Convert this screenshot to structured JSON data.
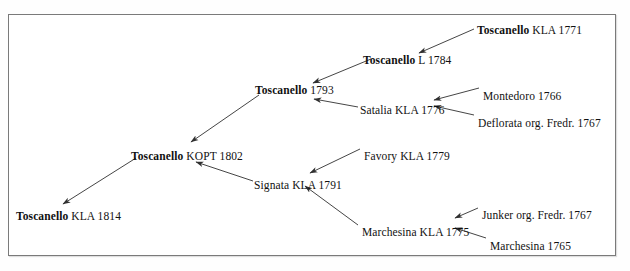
{
  "figure": {
    "kind": "pedigree-chart",
    "border_color": "#7a7a7a",
    "background": "#ffffff",
    "text_color": "#111111",
    "arrow_color": "#303030"
  },
  "nodes": [
    {
      "id": "toscanello-kla-1771",
      "name": "Toscanello",
      "bold": true,
      "detail": "KLA 1771",
      "x": 477,
      "y": 24,
      "align": "left"
    },
    {
      "id": "toscanello-l-1784",
      "name": "Toscanello",
      "bold": true,
      "detail": "L 1784",
      "x": 363,
      "y": 54,
      "align": "left"
    },
    {
      "id": "toscanello-1793",
      "name": "Toscanello",
      "bold": true,
      "detail": "1793",
      "x": 255,
      "y": 84,
      "align": "left"
    },
    {
      "id": "satalia-kla-1776",
      "name": "",
      "bold": false,
      "detail": "Satalia KLA 1776",
      "x": 360,
      "y": 104,
      "align": "left"
    },
    {
      "id": "montedoro-1766",
      "name": "",
      "bold": false,
      "detail": "Montedoro 1766",
      "x": 483,
      "y": 90,
      "align": "left"
    },
    {
      "id": "deflorata-org-fredr-1767",
      "name": "",
      "bold": false,
      "detail": "Deflorata org. Fredr. 1767",
      "x": 478,
      "y": 117,
      "align": "left"
    },
    {
      "id": "toscanello-kopt-1802",
      "name": "Toscanello",
      "bold": true,
      "detail": "KOPT 1802",
      "x": 131,
      "y": 150,
      "align": "left"
    },
    {
      "id": "favory-kla-1779",
      "name": "",
      "bold": false,
      "detail": "Favory KLA 1779",
      "x": 364,
      "y": 150,
      "align": "left"
    },
    {
      "id": "signata-kla-1791",
      "name": "",
      "bold": false,
      "detail": "Signata KLA 1791",
      "x": 254,
      "y": 179,
      "align": "left"
    },
    {
      "id": "toscanello-kla-1814",
      "name": "Toscanello",
      "bold": true,
      "detail": "KLA 1814",
      "x": 16,
      "y": 210,
      "align": "left"
    },
    {
      "id": "marchesina-kla-1775",
      "name": "",
      "bold": false,
      "detail": "Marchesina KLA 1775",
      "x": 362,
      "y": 226,
      "align": "left"
    },
    {
      "id": "junker-org-fredr-1767",
      "name": "",
      "bold": false,
      "detail": "Junker org. Fredr. 1767",
      "x": 482,
      "y": 209,
      "align": "left"
    },
    {
      "id": "marchesina-1765",
      "name": "",
      "bold": false,
      "detail": "Marchesina 1765",
      "x": 490,
      "y": 240,
      "align": "left"
    }
  ],
  "edges": [
    {
      "id": "edge-1771-to-1784",
      "from": "toscanello-kla-1771",
      "to": "toscanello-l-1784",
      "x1": 474,
      "y1": 29,
      "x2": 419,
      "y2": 53
    },
    {
      "id": "edge-1784-to-1793",
      "from": "toscanello-l-1784",
      "to": "toscanello-1793",
      "x1": 371,
      "y1": 59,
      "x2": 313,
      "y2": 83
    },
    {
      "id": "edge-satalia-to-1793",
      "from": "satalia-kla-1776",
      "to": "toscanello-1793",
      "x1": 358,
      "y1": 107,
      "x2": 314,
      "y2": 99
    },
    {
      "id": "edge-montedoro-to-satalia",
      "from": "montedoro-1766",
      "to": "satalia-kla-1776",
      "x1": 479,
      "y1": 88,
      "x2": 434,
      "y2": 100
    },
    {
      "id": "edge-deflorata-to-satalia",
      "from": "deflorata-org-fredr-1767",
      "to": "satalia-kla-1776",
      "x1": 474,
      "y1": 115,
      "x2": 434,
      "y2": 106
    },
    {
      "id": "edge-1793-to-kopt1802",
      "from": "toscanello-1793",
      "to": "toscanello-kopt-1802",
      "x1": 259,
      "y1": 95,
      "x2": 191,
      "y2": 142
    },
    {
      "id": "edge-kopt1802-to-1814",
      "from": "toscanello-kopt-1802",
      "to": "toscanello-kla-1814",
      "x1": 136,
      "y1": 158,
      "x2": 63,
      "y2": 204
    },
    {
      "id": "edge-signata-to-kopt1802",
      "from": "signata-kla-1791",
      "to": "toscanello-kopt-1802",
      "x1": 253,
      "y1": 181,
      "x2": 196,
      "y2": 162
    },
    {
      "id": "edge-favory-to-signata",
      "from": "favory-kla-1779",
      "to": "signata-kla-1791",
      "x1": 360,
      "y1": 149,
      "x2": 310,
      "y2": 173
    },
    {
      "id": "edge-marchesina1775-to-signata",
      "from": "marchesina-kla-1775",
      "to": "signata-kla-1791",
      "x1": 358,
      "y1": 225,
      "x2": 305,
      "y2": 186
    },
    {
      "id": "edge-junker-to-marchesina1775",
      "from": "junker-org-fredr-1767",
      "to": "marchesina-kla-1775",
      "x1": 478,
      "y1": 208,
      "x2": 455,
      "y2": 218
    },
    {
      "id": "edge-marchesina1765-to-marchesina1775",
      "from": "marchesina-1765",
      "to": "marchesina-kla-1775",
      "x1": 486,
      "y1": 238,
      "x2": 455,
      "y2": 228
    }
  ]
}
